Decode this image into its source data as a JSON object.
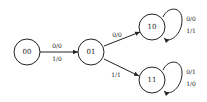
{
  "diagram": {
    "type": "state-machine",
    "states": [
      {
        "id": "s00",
        "label": "00"
      },
      {
        "id": "s01",
        "label": "01"
      },
      {
        "id": "s10",
        "label": "10"
      },
      {
        "id": "s11",
        "label": "11"
      }
    ],
    "transitions": [
      {
        "from": "00",
        "to": "01",
        "labels": [
          "0/0",
          "1/0"
        ]
      },
      {
        "from": "01",
        "to": "10",
        "labels": [
          "0/0"
        ]
      },
      {
        "from": "01",
        "to": "11",
        "labels": [
          "1/1"
        ]
      },
      {
        "from": "10",
        "to": "10",
        "labels": [
          "0/0",
          "1/1"
        ]
      },
      {
        "from": "11",
        "to": "11",
        "labels": [
          "0/1",
          "1/0"
        ]
      }
    ],
    "colors": {
      "stroke": "#222222",
      "fill": "#ffffff",
      "background": "#ffffff"
    }
  }
}
